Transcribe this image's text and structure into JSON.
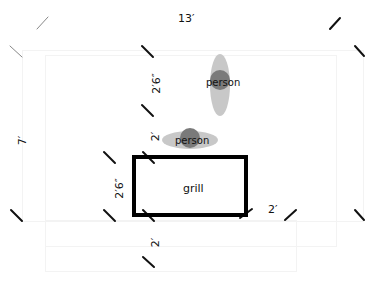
{
  "diagram": {
    "dimensions": {
      "top_width": "13′",
      "left_height": "7′",
      "person_gap": "2′6″",
      "person_to_grill": "2′",
      "grill_depth": "2′6″",
      "grill_to_edge": "2′",
      "grill_right": "2′"
    },
    "objects": {
      "person_standing": "person",
      "person_lying": "person",
      "grill": "grill"
    },
    "colors": {
      "grill_border": "#000000",
      "person_body": "#7a7a7a",
      "person_shadow": "#c8c8c8",
      "tick_marks": "#111111"
    }
  }
}
